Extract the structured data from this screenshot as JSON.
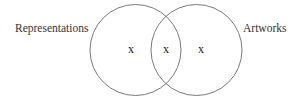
{
  "diagram": {
    "type": "venn",
    "sets": [
      {
        "label": "Representations",
        "region_mark": "x"
      },
      {
        "label": "Artworks",
        "region_mark": "x"
      }
    ],
    "intersection": {
      "region_mark": "x"
    },
    "colors": {
      "stroke": "#6b6b6b",
      "text": "#333333",
      "background": "#ffffff"
    }
  }
}
